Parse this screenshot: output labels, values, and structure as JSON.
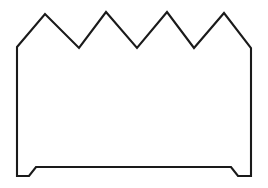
{
  "canvas": {
    "width": 268,
    "height": 188,
    "background_color": "#ffffff",
    "title": "Zigzag-topped outline figure"
  },
  "figure": {
    "name": "zigzag-crown-outline",
    "stroke_color": "#1a1a1a",
    "fill_color": "#ffffff",
    "stroke_width": 2.1,
    "peak_count": 4,
    "valley_count": 3,
    "foot_count": 2,
    "path_d": "M 17 47 L 45 14 L 79 48 L 106 12 L 137 48 L 167 12 L 194 48 L 224 13 L 251 48 L 251 176 L 238 176 L 231 167 L 36 167 L 29 176 L 17 176 Z",
    "vertices": [
      {
        "name": "left-shoulder",
        "x": 17,
        "y": 47
      },
      {
        "name": "peak-1",
        "x": 45,
        "y": 14
      },
      {
        "name": "valley-1",
        "x": 79,
        "y": 48
      },
      {
        "name": "peak-2",
        "x": 106,
        "y": 12
      },
      {
        "name": "valley-2",
        "x": 137,
        "y": 48
      },
      {
        "name": "peak-3",
        "x": 167,
        "y": 12
      },
      {
        "name": "valley-3",
        "x": 194,
        "y": 48
      },
      {
        "name": "peak-4",
        "x": 224,
        "y": 13
      },
      {
        "name": "right-shoulder",
        "x": 251,
        "y": 48
      },
      {
        "name": "right-foot-outer-bottom",
        "x": 251,
        "y": 176
      },
      {
        "name": "right-foot-inner-bottom",
        "x": 238,
        "y": 176
      },
      {
        "name": "right-foot-top",
        "x": 231,
        "y": 167
      },
      {
        "name": "left-foot-top",
        "x": 36,
        "y": 167
      },
      {
        "name": "left-foot-inner-bottom",
        "x": 29,
        "y": 176
      },
      {
        "name": "left-foot-outer-bottom",
        "x": 17,
        "y": 176
      }
    ]
  }
}
